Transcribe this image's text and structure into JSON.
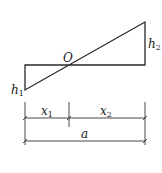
{
  "diagram": {
    "labels": {
      "origin": "O",
      "h1": {
        "main": "h",
        "sub": "1"
      },
      "h2": {
        "main": "h",
        "sub": "2"
      },
      "x1": {
        "main": "x",
        "sub": "1"
      },
      "x2": {
        "main": "x",
        "sub": "2"
      },
      "a": "a"
    },
    "colors": {
      "stroke": "#2a2a2a",
      "background": "#ffffff"
    }
  }
}
